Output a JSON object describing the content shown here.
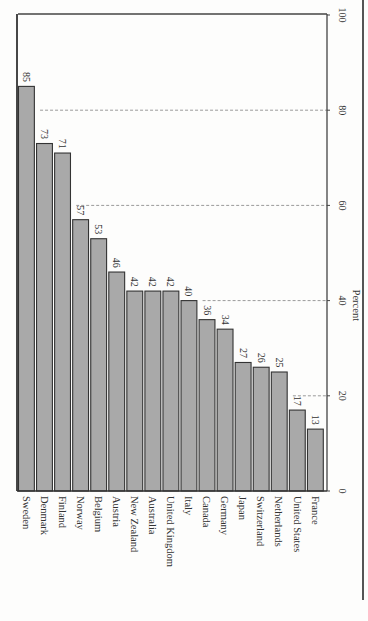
{
  "chart_data": {
    "type": "bar",
    "orientation": "vertical bars, rotated page (labels rotated 90°)",
    "title": "",
    "xlabel": "",
    "ylabel": "Percent",
    "ylim": [
      0,
      100
    ],
    "yticks": [
      0,
      20,
      40,
      60,
      80,
      100
    ],
    "grid": "dotted horizontal gridlines at 20, 40, 60, 80 (drawn only where not covered by bars)",
    "categories": [
      "Sweden",
      "Denmark",
      "Finland",
      "Norway",
      "Belgium",
      "Austria",
      "New Zealand",
      "Australia",
      "United Kingdom",
      "Italy",
      "Canada",
      "Germany",
      "Japan",
      "Switzerland",
      "Netherlands",
      "United States",
      "France"
    ],
    "values": [
      85,
      73,
      71,
      57,
      53,
      46,
      42,
      42,
      42,
      40,
      36,
      34,
      27,
      26,
      25,
      17,
      13
    ],
    "data_labels": true,
    "bar_color": "#a9a9a9",
    "legend": null
  },
  "axis": {
    "label": "Percent",
    "ticks": [
      "0",
      "20",
      "40",
      "60",
      "80",
      "100"
    ]
  }
}
